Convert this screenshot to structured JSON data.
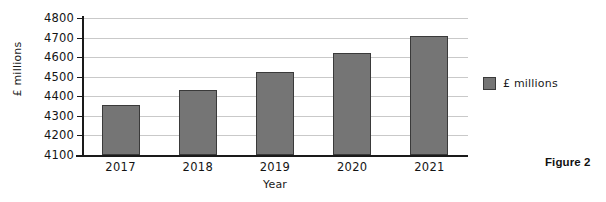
{
  "chart_data": {
    "type": "bar",
    "title": "",
    "categories": [
      "2017",
      "2018",
      "2019",
      "2020",
      "2021"
    ],
    "values": [
      4355,
      4430,
      4525,
      4620,
      4710
    ],
    "series": [
      {
        "name": "£ millions",
        "values": [
          4355,
          4430,
          4525,
          4620,
          4710
        ],
        "color": "#757575"
      }
    ],
    "xlabel": "Year",
    "ylabel": "£ millions",
    "ylim": [
      4100,
      4800
    ],
    "ytick_step": 100,
    "ytick_labels": [
      "4800",
      "4700",
      "4600",
      "4500",
      "4400",
      "4300",
      "4200",
      "4100"
    ],
    "ytick_values": [
      4800,
      4700,
      4600,
      4500,
      4400,
      4300,
      4200,
      4100
    ],
    "grid": true,
    "grid_axis": "y",
    "legend_position": "right",
    "legend_entries": [
      "£ millions"
    ]
  },
  "caption": {
    "text": "Figure 2"
  },
  "colors": {
    "bar_fill": "#757575",
    "bar_stroke": "#3a3a3a",
    "gridline": "#c9c9c9",
    "axis": "#1a1a1a",
    "background": "#ffffff"
  }
}
